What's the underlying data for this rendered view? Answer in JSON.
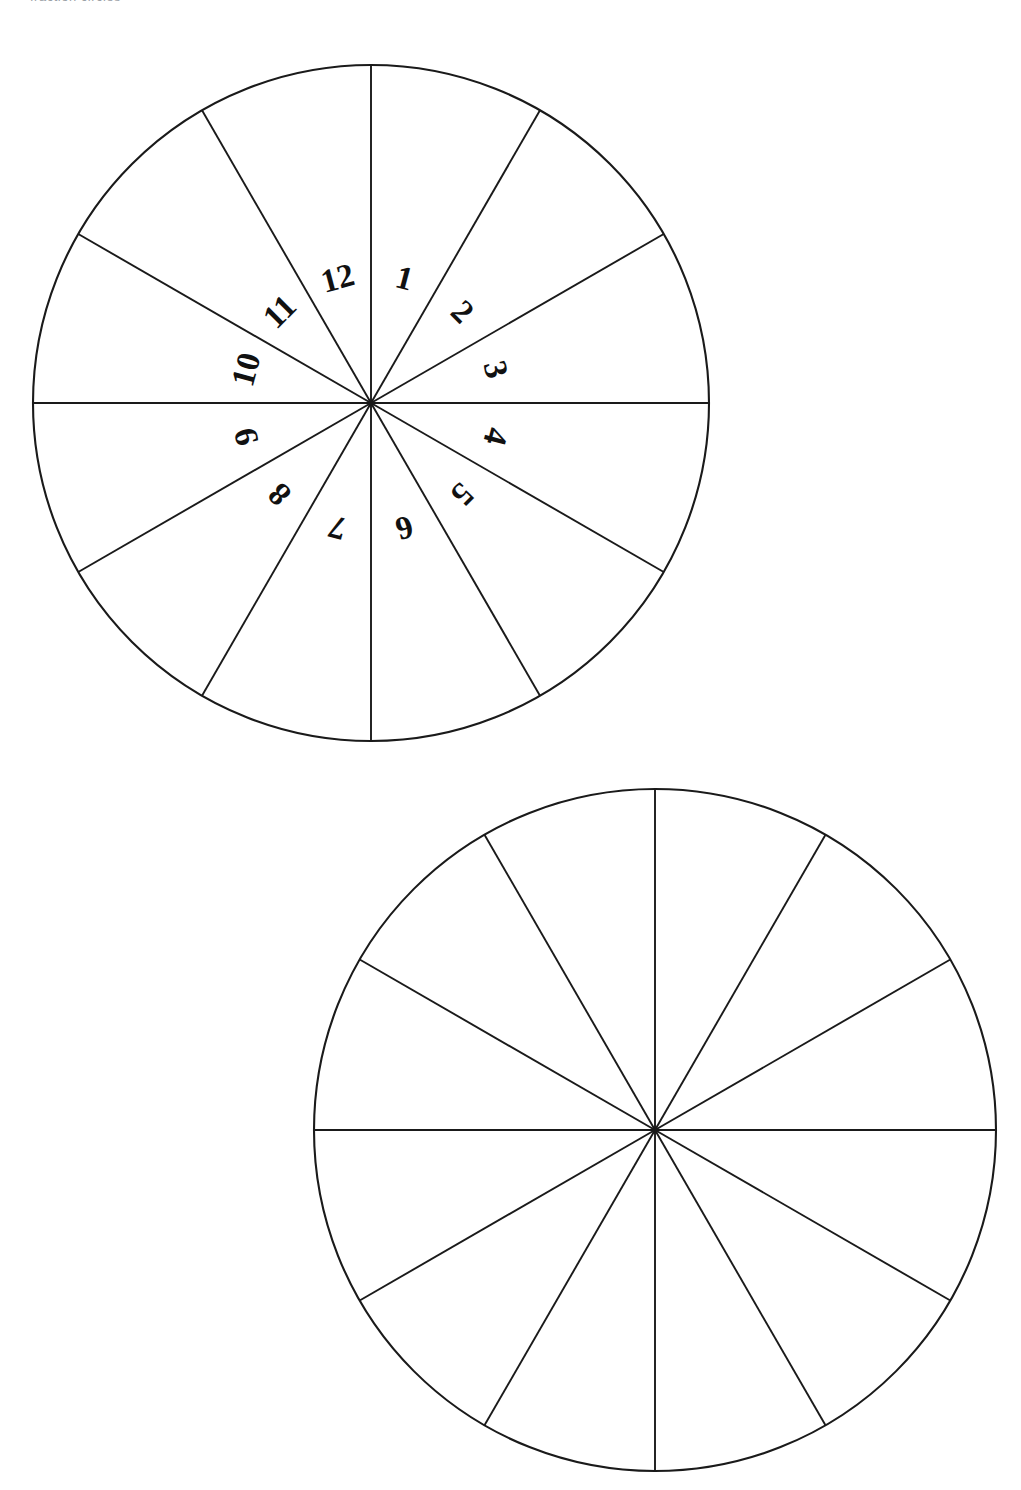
{
  "page": {
    "header_fragment": "fraction circles",
    "background_color": "#ffffff",
    "ink_color": "#1a1a1a",
    "width": 1021,
    "height": 1490
  },
  "chart_data": {
    "type": "pie",
    "title": "",
    "subtitle": "",
    "xlabel": "",
    "ylabel": "",
    "legend": [],
    "grid": false,
    "slice_count": 12,
    "slice_angle_degrees": 30,
    "slice_value_each": 1,
    "categories": [
      "1",
      "2",
      "3",
      "4",
      "5",
      "6",
      "7",
      "8",
      "9",
      "10",
      "11",
      "12"
    ],
    "values": [
      1,
      1,
      1,
      1,
      1,
      1,
      1,
      1,
      1,
      1,
      1,
      1
    ],
    "figures": [
      {
        "name": "labelled-twelfths-circle",
        "cx": 371,
        "cy": 403,
        "r": 338,
        "labelled": true,
        "label_radius": 126,
        "labels": [
          "1",
          "2",
          "3",
          "4",
          "5",
          "6",
          "7",
          "8",
          "9",
          "10",
          "11",
          "12"
        ]
      },
      {
        "name": "blank-twelfths-circle",
        "cx": 655,
        "cy": 1130,
        "r": 341,
        "labelled": false,
        "label_radius": 126,
        "labels": []
      }
    ]
  },
  "figures": {
    "top": {
      "caption": "",
      "sector_labels": [
        "1",
        "2",
        "3",
        "4",
        "5",
        "6",
        "7",
        "8",
        "9",
        "10",
        "11",
        "12"
      ]
    },
    "bottom": {
      "caption": "",
      "sector_labels": []
    }
  }
}
